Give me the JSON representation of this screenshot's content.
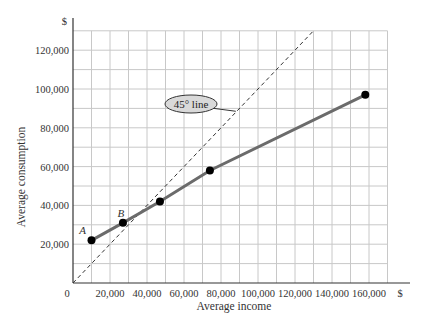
{
  "chart_data": {
    "type": "line",
    "title": "",
    "xlabel": "Average income",
    "ylabel": "Average consumption",
    "x_unit_label": "$",
    "y_unit_label": "$",
    "xlim": [
      0,
      170000
    ],
    "ylim": [
      0,
      130000
    ],
    "grid": true,
    "grid_step": 10000,
    "x_ticks": [
      {
        "value": 0,
        "label": "0"
      },
      {
        "value": 20000,
        "label": "20,000"
      },
      {
        "value": 40000,
        "label": "40,000"
      },
      {
        "value": 60000,
        "label": "60,000"
      },
      {
        "value": 80000,
        "label": "80,000"
      },
      {
        "value": 100000,
        "label": "100,000"
      },
      {
        "value": 120000,
        "label": "120,000"
      },
      {
        "value": 140000,
        "label": "140,000"
      },
      {
        "value": 160000,
        "label": "160,000"
      }
    ],
    "y_ticks": [
      {
        "value": 20000,
        "label": "20,000"
      },
      {
        "value": 40000,
        "label": "40,000"
      },
      {
        "value": 60000,
        "label": "60,000"
      },
      {
        "value": 80000,
        "label": "80,000"
      },
      {
        "value": 100000,
        "label": "100,000"
      },
      {
        "value": 120000,
        "label": "120,000"
      }
    ],
    "series": [
      {
        "name": "Average consumption vs. average income",
        "color": "#666666",
        "points": [
          {
            "x": 10000,
            "y": 22000,
            "label": "A"
          },
          {
            "x": 27000,
            "y": 31000,
            "label": "B"
          },
          {
            "x": 47000,
            "y": 42000,
            "label": ""
          },
          {
            "x": 74000,
            "y": 58000,
            "label": ""
          },
          {
            "x": 158000,
            "y": 97000,
            "label": ""
          }
        ]
      },
      {
        "name": "45° line",
        "style": "dashed",
        "color": "#333333",
        "points": [
          {
            "x": 0,
            "y": 0
          },
          {
            "x": 130000,
            "y": 130000
          }
        ]
      }
    ],
    "annotations": [
      {
        "text": "45° line",
        "type": "callout",
        "x": 56000,
        "y": 100000,
        "points_to": {
          "x": 88000,
          "y": 88000
        }
      }
    ]
  },
  "colors": {
    "grid": "#c8c8c8",
    "axis": "#333333",
    "series_line": "#6b6b6b",
    "marker": "#000000",
    "callout_fill": "#d9d9d9"
  }
}
